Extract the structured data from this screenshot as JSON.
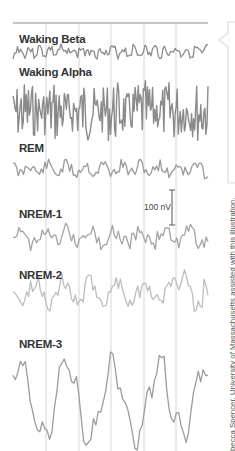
{
  "chart_data": {
    "type": "line",
    "title": "",
    "xlabel": "",
    "ylabel": "",
    "grid": {
      "vertical_lines_x": [
        46,
        79,
        111,
        144,
        176
      ],
      "horizontal_top_rule": true
    },
    "legend": null,
    "scale_bar": {
      "label": "100 nV",
      "length_px": 35
    },
    "series": [
      {
        "name": "Waking Beta",
        "band": [
          43,
          60
        ],
        "amplitude": "low",
        "frequency": "very high",
        "color": "#8c8c8c",
        "seed": 3,
        "freq": 0.9,
        "n": 130
      },
      {
        "name": "Waking Alpha",
        "band": [
          80,
          143
        ],
        "amplitude": "high",
        "frequency": "high",
        "color": "#8a8a8a",
        "seed": 7,
        "freq": 1.0,
        "n": 190
      },
      {
        "name": "REM",
        "band": [
          158,
          180
        ],
        "amplitude": "low",
        "frequency": "mixed",
        "color": "#9a9a9a",
        "seed": 11,
        "freq": 0.6,
        "n": 110
      },
      {
        "name": "NREM-1",
        "band": [
          222,
          252
        ],
        "amplitude": "low-medium",
        "frequency": "theta",
        "color": "#a3a3a3",
        "seed": 19,
        "freq": 0.5,
        "n": 100
      },
      {
        "name": "NREM-2",
        "band": [
          262,
          322
        ],
        "amplitude": "medium",
        "frequency": "spindles/K-complex",
        "color": "#bdbdbd",
        "seed": 23,
        "freq": 0.45,
        "n": 100
      },
      {
        "name": "NREM-3",
        "band": [
          352,
          450
        ],
        "amplitude": "high",
        "frequency": "delta (slow)",
        "color": "#9c9c9c",
        "seed": 31,
        "freq": 0.18,
        "n": 80
      }
    ]
  },
  "labels": {
    "waking_beta": "Waking Beta",
    "waking_alpha": "Waking Alpha",
    "rem": "REM",
    "nrem1": "NREM-1",
    "nrem2": "NREM-2",
    "nrem3": "NREM-3"
  },
  "scale": {
    "label": "100 nV"
  },
  "credit": "becca Spencer, University of Massachusetts assisted with this illustration."
}
